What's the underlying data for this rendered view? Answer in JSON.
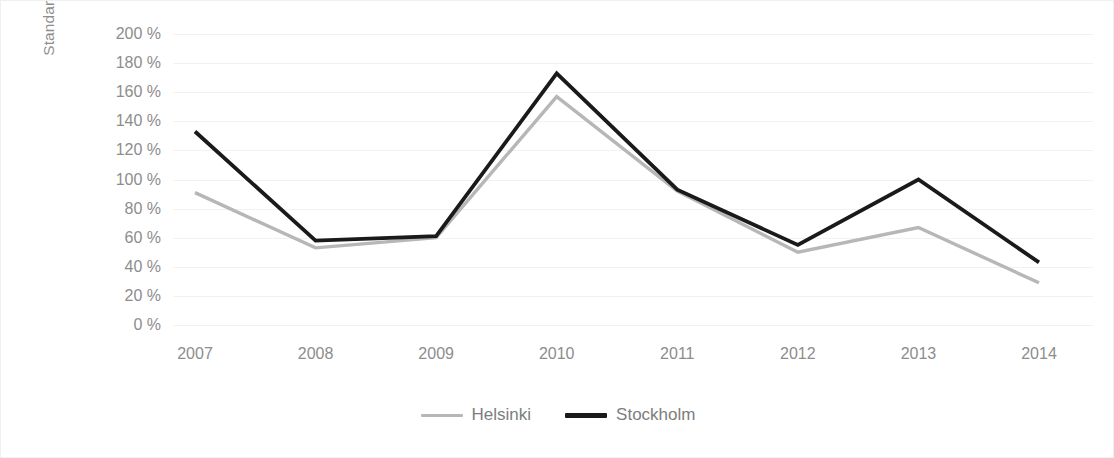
{
  "chart_data": {
    "type": "line",
    "title": "",
    "xlabel": "",
    "ylabel": "Standard deviation, % of the average daily closing price",
    "ylabel_lines": [
      "Standard deviation, % of the average daily",
      "closing price"
    ],
    "categories": [
      "2007",
      "2008",
      "2009",
      "2010",
      "2011",
      "2012",
      "2013",
      "2014"
    ],
    "ylim": [
      0,
      200
    ],
    "ytick_step": 20,
    "ytick_labels": [
      "200 %",
      "180 %",
      "160 %",
      "140 %",
      "120 %",
      "100 %",
      "80 %",
      "60 %",
      "40 %",
      "20 %",
      "0 %"
    ],
    "ytick_values": [
      200,
      180,
      160,
      140,
      120,
      100,
      80,
      60,
      40,
      20,
      0
    ],
    "grid": true,
    "legend_position": "bottom",
    "series": [
      {
        "name": "Helsinki",
        "color": "#b7b7b7",
        "values": [
          91,
          53,
          60,
          157,
          92,
          50,
          67,
          29
        ]
      },
      {
        "name": "Stockholm",
        "color": "#1a1a1a",
        "values": [
          133,
          58,
          61,
          173,
          93,
          55,
          100,
          43
        ]
      }
    ]
  },
  "axis": {
    "unit_suffix": "%"
  }
}
